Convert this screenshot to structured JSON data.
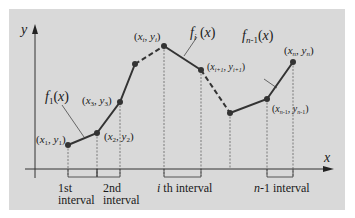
{
  "diagram": {
    "type": "piecewise-linear-interpolation",
    "axes": {
      "x_label": "x",
      "y_label": "y"
    },
    "points": [
      {
        "id": "p1",
        "label": "(x1, y1)"
      },
      {
        "id": "p2",
        "label": "(x2, y2)"
      },
      {
        "id": "p3",
        "label": "(x3, y3)"
      },
      {
        "id": "pi",
        "label": "(xi, yi)"
      },
      {
        "id": "pi1",
        "label": "(xi+1, yi+1)"
      },
      {
        "id": "pn1",
        "label": "(xn-1, yn-1)"
      },
      {
        "id": "pn",
        "label": "(xn, yn)"
      }
    ],
    "functions": {
      "f1": "f1(x)",
      "fi": "fi(x)",
      "fn1": "fn-1(x)"
    },
    "intervals": {
      "first": [
        "1st",
        "interval"
      ],
      "second": [
        "2nd",
        "interval"
      ],
      "ith": "i th interval",
      "n1": "n-1 interval"
    }
  }
}
